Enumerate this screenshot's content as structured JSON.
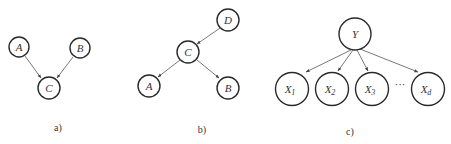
{
  "diagrams": [
    {
      "caption": "a)",
      "nodes": [
        {
          "id": "A",
          "label": "A"
        },
        {
          "id": "B",
          "label": "B"
        },
        {
          "id": "C",
          "label": "C"
        }
      ],
      "edges": [
        {
          "from": "A",
          "to": "C"
        },
        {
          "from": "B",
          "to": "C"
        }
      ]
    },
    {
      "caption": "b)",
      "nodes": [
        {
          "id": "D",
          "label": "D"
        },
        {
          "id": "C",
          "label": "C"
        },
        {
          "id": "A",
          "label": "A"
        },
        {
          "id": "B",
          "label": "B"
        }
      ],
      "edges": [
        {
          "from": "D",
          "to": "C"
        },
        {
          "from": "C",
          "to": "A"
        },
        {
          "from": "C",
          "to": "B"
        }
      ]
    },
    {
      "caption": "c)",
      "nodes": [
        {
          "id": "Y",
          "label": "Y"
        },
        {
          "id": "X1",
          "label": "X",
          "sub": "1"
        },
        {
          "id": "X2",
          "label": "X",
          "sub": "2"
        },
        {
          "id": "X3",
          "label": "X",
          "sub": "3"
        },
        {
          "id": "Xd",
          "label": "X",
          "sub": "d"
        }
      ],
      "ellipsis": "···",
      "edges": [
        {
          "from": "Y",
          "to": "X1"
        },
        {
          "from": "Y",
          "to": "X2"
        },
        {
          "from": "Y",
          "to": "X3"
        },
        {
          "from": "Y",
          "to": "Xd"
        }
      ]
    }
  ]
}
